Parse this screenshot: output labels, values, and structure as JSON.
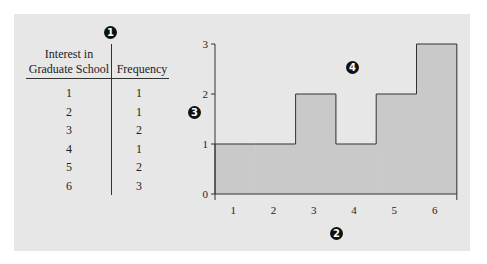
{
  "table": {
    "headers": [
      "Interest in\nGraduate School",
      "Frequency"
    ],
    "header_col1_line1": "Interest in",
    "header_col1_line2": "Graduate School",
    "header_col2": "Frequency",
    "rows": [
      {
        "value": "1",
        "frequency": "1"
      },
      {
        "value": "2",
        "frequency": "1"
      },
      {
        "value": "3",
        "frequency": "2"
      },
      {
        "value": "4",
        "frequency": "1"
      },
      {
        "value": "5",
        "frequency": "2"
      },
      {
        "value": "6",
        "frequency": "3"
      }
    ]
  },
  "annotations": {
    "badge1": "1",
    "badge2": "2",
    "badge3": "3",
    "badge4": "4"
  },
  "colors": {
    "panel_bg": "#e7e7e7",
    "histogram_fill": "#c9c9c9",
    "stroke": "#333333",
    "badge": "#111111"
  },
  "chart_data": {
    "type": "bar",
    "title": "",
    "xlabel": "",
    "ylabel": "",
    "categories": [
      "1",
      "2",
      "3",
      "4",
      "5",
      "6"
    ],
    "values": [
      1,
      1,
      2,
      1,
      2,
      3
    ],
    "y_ticks": [
      "0",
      "1",
      "2",
      "3"
    ],
    "ylim": [
      0,
      3
    ],
    "grid": false,
    "legend": "none",
    "style": "histogram (adjacent bars, step outline, filled)",
    "annotations": [
      {
        "label": "1",
        "position": "above table divider"
      },
      {
        "label": "2",
        "position": "below x-axis"
      },
      {
        "label": "3",
        "position": "left of y-axis"
      },
      {
        "label": "4",
        "position": "chart area above bars"
      }
    ]
  }
}
